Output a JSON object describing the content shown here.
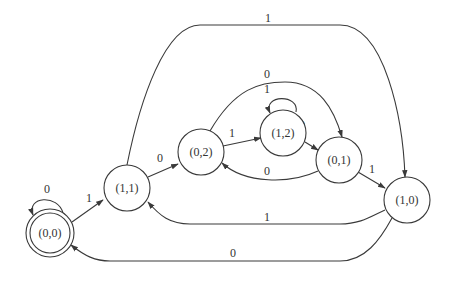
{
  "diagram": {
    "type": "finite-state-automaton",
    "nodes": [
      {
        "id": "s00",
        "label": "(0,0)",
        "accepting": true
      },
      {
        "id": "s11",
        "label": "(1,1)",
        "accepting": false
      },
      {
        "id": "s02",
        "label": "(0,2)",
        "accepting": false
      },
      {
        "id": "s12",
        "label": "(1,2)",
        "accepting": false
      },
      {
        "id": "s01",
        "label": "(0,1)",
        "accepting": false
      },
      {
        "id": "s10",
        "label": "(1,0)",
        "accepting": false
      }
    ],
    "edges": [
      {
        "from": "(0,0)",
        "to": "(0,0)",
        "label": "0"
      },
      {
        "from": "(0,0)",
        "to": "(1,1)",
        "label": "1"
      },
      {
        "from": "(1,1)",
        "to": "(0,2)",
        "label": "0"
      },
      {
        "from": "(1,1)",
        "to": "(1,0)",
        "label": "1"
      },
      {
        "from": "(0,2)",
        "to": "(1,2)",
        "label": "1"
      },
      {
        "from": "(0,2)",
        "to": "(0,1)",
        "label": "0"
      },
      {
        "from": "(1,2)",
        "to": "(1,2)",
        "label": "1"
      },
      {
        "from": "(1,2)",
        "to": "(0,1)",
        "label": "0"
      },
      {
        "from": "(0,1)",
        "to": "(0,2)",
        "label": "0"
      },
      {
        "from": "(0,1)",
        "to": "(1,0)",
        "label": "1"
      },
      {
        "from": "(1,0)",
        "to": "(1,1)",
        "label": "1"
      },
      {
        "from": "(1,0)",
        "to": "(0,0)",
        "label": "0"
      }
    ]
  }
}
